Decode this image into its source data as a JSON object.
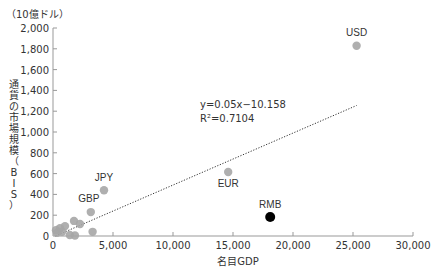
{
  "chart_data": {
    "type": "scatter",
    "title": "",
    "unit_label": "（10億ドル）",
    "xlabel": "名目GDP",
    "ylabel": "通貨の市場規模（BIS）",
    "xlim": [
      0,
      30000
    ],
    "ylim": [
      0,
      2000
    ],
    "x_ticks": [
      0,
      5000,
      10000,
      15000,
      20000,
      25000,
      30000
    ],
    "x_tick_labels": [
      "0",
      "5,000",
      "10,000",
      "15,000",
      "20,000",
      "25,000",
      "30,000"
    ],
    "y_ticks": [
      0,
      200,
      400,
      600,
      800,
      1000,
      1200,
      1400,
      1600,
      1800,
      2000
    ],
    "y_tick_labels": [
      "0",
      "200",
      "400",
      "600",
      "800",
      "1,000",
      "1,200",
      "1,400",
      "1,600",
      "1,800",
      "2,000"
    ],
    "grid": false,
    "series": [
      {
        "name": "currencies",
        "color": "#a6a6a6",
        "points": [
          {
            "label": "USD",
            "x": 25300,
            "y": 1830
          },
          {
            "label": "EUR",
            "x": 14600,
            "y": 615
          },
          {
            "label": "JPY",
            "x": 4250,
            "y": 440
          },
          {
            "label": "GBP",
            "x": 3150,
            "y": 230
          },
          {
            "label": "",
            "x": 3300,
            "y": 40
          },
          {
            "label": "",
            "x": 1750,
            "y": 145
          },
          {
            "label": "",
            "x": 2250,
            "y": 115
          },
          {
            "label": "",
            "x": 1000,
            "y": 95
          },
          {
            "label": "",
            "x": 580,
            "y": 75
          },
          {
            "label": "",
            "x": 250,
            "y": 55
          },
          {
            "label": "",
            "x": 750,
            "y": 40
          },
          {
            "label": "",
            "x": 330,
            "y": 30
          },
          {
            "label": "",
            "x": 1400,
            "y": 10
          },
          {
            "label": "",
            "x": 1830,
            "y": 5
          }
        ]
      },
      {
        "name": "RMB",
        "color": "#000000",
        "points": [
          {
            "label": "RMB",
            "x": 18100,
            "y": 183
          }
        ]
      }
    ],
    "trendline": {
      "slope": 0.05,
      "intercept": -10.158,
      "x_range": [
        200,
        25300
      ],
      "equation_text": "y=0.05x−10.158",
      "r2_text": "R²=0.7104",
      "style": "dotted"
    }
  }
}
